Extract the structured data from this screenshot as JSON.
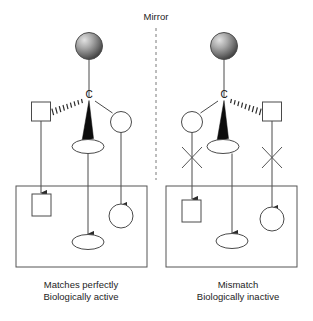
{
  "figure": {
    "mirror_label": "Mirror",
    "carbon_label": "C",
    "panels": [
      {
        "id": "left",
        "caption_line1": "Matches perfectly",
        "caption_line2": "Biologically active",
        "substituents": [
          {
            "name": "sphere",
            "shape": "sphere",
            "bond": "plain",
            "position": "top"
          },
          {
            "name": "square",
            "shape": "square",
            "bond": "hashed",
            "position": "left"
          },
          {
            "name": "circle",
            "shape": "circle",
            "bond": "plain",
            "position": "right"
          },
          {
            "name": "ellipse",
            "shape": "ellipse",
            "bond": "wedge",
            "position": "bottom"
          }
        ],
        "receptor_sites": [
          {
            "name": "square-site",
            "shape": "square",
            "fit": "match"
          },
          {
            "name": "ellipse-site",
            "shape": "ellipse",
            "fit": "match"
          },
          {
            "name": "circle-site",
            "shape": "circle",
            "fit": "match"
          }
        ],
        "blocked_marks": 0
      },
      {
        "id": "right",
        "caption_line1": "Mismatch",
        "caption_line2": "Biologically inactive",
        "substituents": [
          {
            "name": "sphere",
            "shape": "sphere",
            "bond": "plain",
            "position": "top"
          },
          {
            "name": "circle",
            "shape": "circle",
            "bond": "plain",
            "position": "left"
          },
          {
            "name": "square",
            "shape": "square",
            "bond": "hashed",
            "position": "right"
          },
          {
            "name": "ellipse",
            "shape": "ellipse",
            "bond": "wedge",
            "position": "bottom"
          }
        ],
        "receptor_sites": [
          {
            "name": "square-site",
            "shape": "square",
            "fit": "mismatch"
          },
          {
            "name": "ellipse-site",
            "shape": "ellipse",
            "fit": "mismatch"
          },
          {
            "name": "circle-site",
            "shape": "circle",
            "fit": "mismatch"
          }
        ],
        "blocked_marks": 2
      }
    ],
    "colors": {
      "stroke": "#4a4a4a",
      "wedge_fill": "#0d0d0d",
      "sphere_light": "#d8d8d8",
      "sphere_dark": "#3b3b3b",
      "mirror_dash": "#7a7a7a",
      "text": "#1d1d1d",
      "background": "#ffffff"
    }
  }
}
